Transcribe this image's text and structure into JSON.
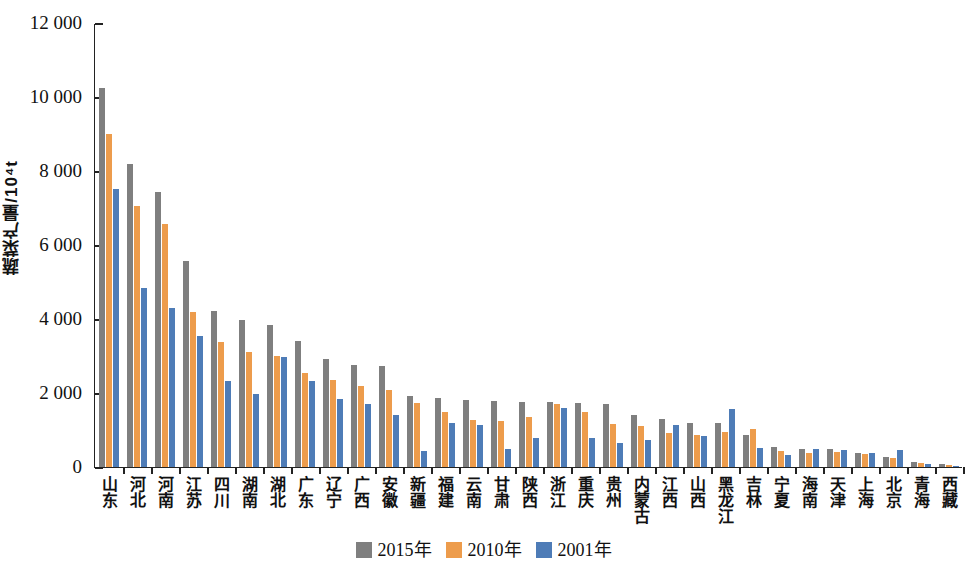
{
  "chart_data": {
    "type": "bar",
    "title": "",
    "subtitle": "",
    "xlabel": "",
    "ylabel": "蔬菜产量/10⁴t",
    "ylim": [
      0,
      12000
    ],
    "ytick_labels": [
      "12 000",
      "10 000",
      "8 000",
      "6 000",
      "4 000",
      "2 000",
      "0"
    ],
    "ytick_values": [
      12000,
      10000,
      8000,
      6000,
      4000,
      2000,
      0
    ],
    "grid": false,
    "legend_position": "bottom-center",
    "colors": {
      "series_2015": "#7f7f7f",
      "series_2010": "#ed9c4c",
      "series_2001": "#4e7cb7",
      "axis": "#222222",
      "background": "#ffffff"
    },
    "categories": [
      "山东",
      "河北",
      "河南",
      "江苏",
      "四川",
      "湖南",
      "湖北",
      "广东",
      "辽宁",
      "广西",
      "安徽",
      "新疆",
      "福建",
      "云南",
      "甘肃",
      "陕西",
      "浙江",
      "重庆",
      "贵州",
      "内蒙古",
      "江西",
      "山西",
      "黑龙江",
      "吉林",
      "宁夏",
      "海南",
      "天津",
      "上海",
      "北京",
      "青海",
      "西藏"
    ],
    "series": [
      {
        "name": "2015年",
        "color": "#7f7f7f",
        "values": [
          10250,
          8200,
          7430,
          5560,
          4220,
          3960,
          3840,
          3400,
          2930,
          2750,
          2720,
          1920,
          1860,
          1800,
          1790,
          1760,
          1760,
          1720,
          1690,
          1400,
          1310,
          1200,
          1180,
          860,
          540,
          490,
          490,
          370,
          280,
          135,
          80
        ]
      },
      {
        "name": "2010年",
        "color": "#ed9c4c",
        "values": [
          8990,
          7050,
          6570,
          4190,
          3370,
          3100,
          3010,
          2540,
          2350,
          2180,
          2080,
          1730,
          1490,
          1270,
          1240,
          1350,
          1700,
          1480,
          1170,
          1100,
          930,
          870,
          940,
          1020,
          420,
          380,
          400,
          340,
          240,
          110,
          60
        ]
      },
      {
        "name": "2001年",
        "color": "#4e7cb7",
        "values": [
          7520,
          4850,
          4290,
          3550,
          2330,
          1960,
          2980,
          2320,
          1840,
          1690,
          1400,
          440,
          1200,
          1140,
          480,
          790,
          1590,
          780,
          640,
          720,
          1130,
          830,
          1580,
          510,
          330,
          480,
          460,
          380,
          460,
          70,
          30
        ]
      }
    ]
  },
  "legend": {
    "items": [
      {
        "label": "2015年",
        "color": "#7f7f7f"
      },
      {
        "label": "2010年",
        "color": "#ed9c4c"
      },
      {
        "label": "2001年",
        "color": "#4e7cb7"
      }
    ]
  }
}
